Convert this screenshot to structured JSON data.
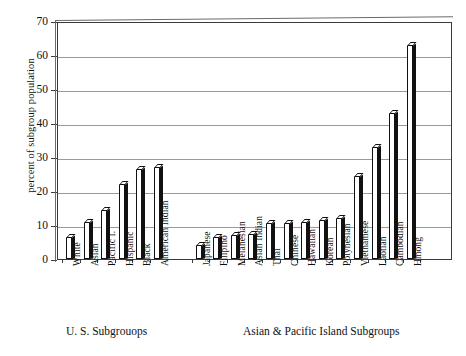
{
  "chart_data": {
    "type": "bar",
    "title": "",
    "subtitle": "",
    "xlabel": "",
    "ylabel": "percent of subgroup population",
    "ylim": [
      0,
      70
    ],
    "yticks": [
      0,
      10,
      20,
      30,
      40,
      50,
      60,
      70
    ],
    "ytick_labels": [
      "0",
      "10",
      "20",
      "30",
      "40",
      "50",
      "60",
      "70"
    ],
    "grid": true,
    "legend": "none",
    "style": "3d-bars-black-white",
    "group_captions": [
      "U. S.  Subgrouops",
      "Asian & Pacific Island Subgroups"
    ],
    "groups": [
      {
        "name": "U. S.  Subgrouops",
        "categories": [
          "White",
          "Asian",
          "Pacific I.",
          "Hispanic",
          "Black",
          "American Indian"
        ],
        "values": [
          6.5,
          11,
          14.5,
          22,
          26.5,
          27
        ]
      },
      {
        "name": "Asian & Pacific Island Subgroups",
        "categories": [
          "Japanese",
          "Filipino",
          "Melanesian",
          "Asian Indian",
          "Thai",
          "Chinese",
          "Hawaiian",
          "Korean",
          "Polynesian",
          "Vietnamese",
          "Laotian",
          "Cambodian",
          "Hmong"
        ],
        "values": [
          4,
          6.5,
          7,
          7.5,
          10.5,
          10.5,
          11,
          11.5,
          12,
          24.5,
          33,
          43,
          63
        ]
      }
    ],
    "categories": [
      "White",
      "Asian",
      "Pacific I.",
      "Hispanic",
      "Black",
      "American Indian",
      "Japanese",
      "Filipino",
      "Melanesian",
      "Asian Indian",
      "Thai",
      "Chinese",
      "Hawaiian",
      "Korean",
      "Polynesian",
      "Vietnamese",
      "Laotian",
      "Cambodian",
      "Hmong"
    ],
    "values": [
      6.5,
      11,
      14.5,
      22,
      26.5,
      27,
      4,
      6.5,
      7,
      7.5,
      10.5,
      10.5,
      11,
      11.5,
      12,
      24.5,
      33,
      43,
      63
    ],
    "colors": {
      "bar_face": "#ffffff",
      "bar_side": "#111111",
      "bar_outline": "#111111",
      "gridline": "#9a9a9a",
      "axis": "#3a3a3a",
      "background": "#ffffff",
      "text": "#111111"
    }
  }
}
